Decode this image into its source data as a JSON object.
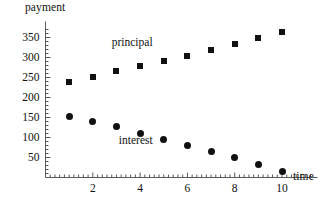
{
  "chart_data": {
    "type": "scatter",
    "title": "",
    "xlabel": "time",
    "ylabel": "payment",
    "xlim": [
      0,
      11.5
    ],
    "ylim": [
      0,
      375
    ],
    "grid": false,
    "legend_position": "inline-annotations",
    "x": [
      1,
      2,
      3,
      4,
      5,
      6,
      7,
      8,
      9,
      10
    ],
    "xticks": [
      2,
      4,
      6,
      8,
      10
    ],
    "xtick_labels": [
      "2",
      "4",
      "6",
      "8",
      "10"
    ],
    "yticks": [
      50,
      100,
      150,
      200,
      250,
      300,
      350
    ],
    "ytick_labels": [
      "50",
      "100",
      "150",
      "200",
      "250",
      "300",
      "350"
    ],
    "series": [
      {
        "name": "principal",
        "marker": "square",
        "color": "#111111",
        "values": [
          240,
          252,
          266,
          279,
          291,
          304,
          318,
          333,
          348,
          363
        ]
      },
      {
        "name": "interest",
        "marker": "circle",
        "color": "#111111",
        "values": [
          153,
          141,
          128,
          111,
          96,
          80,
          64,
          49,
          33,
          15
        ]
      }
    ],
    "annotations": [
      {
        "text": "principal",
        "x": 3.9,
        "y": 337
      },
      {
        "text": "interest",
        "x": 4.2,
        "y": 92
      }
    ]
  },
  "axis": {
    "x_label": "time",
    "y_label": "payment"
  }
}
